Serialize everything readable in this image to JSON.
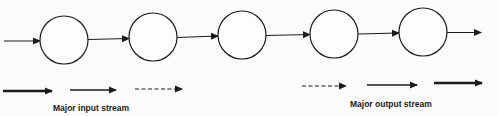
{
  "diagram": {
    "nodes": [
      {
        "id": "n1",
        "cx": 64,
        "cy": 40
      },
      {
        "id": "n2",
        "cx": 153,
        "cy": 37
      },
      {
        "id": "n3",
        "cx": 242,
        "cy": 35
      },
      {
        "id": "n4",
        "cx": 334,
        "cy": 34
      },
      {
        "id": "n5",
        "cx": 423,
        "cy": 32
      }
    ],
    "legend": {
      "input_label": "Major input stream",
      "output_label": "Major output stream"
    },
    "colors": {
      "stroke": "#1a1a1a",
      "background": "#fbfbfa"
    }
  }
}
